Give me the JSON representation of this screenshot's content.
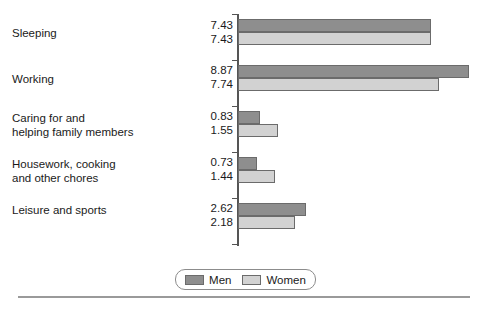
{
  "chart_data": {
    "type": "bar",
    "orientation": "horizontal",
    "title": "",
    "subtitle": "",
    "xlabel": "",
    "ylabel": "",
    "grid": false,
    "legend_position": "bottom-center",
    "xlim": [
      0,
      9.3
    ],
    "categories": [
      "Sleeping",
      "Working",
      "Caring for and\nhelping family members",
      "Housework, cooking\nand other chores",
      "Leisure and sports"
    ],
    "series": [
      {
        "name": "Men",
        "color": "#8e8e8e",
        "values": [
          7.43,
          8.87,
          0.83,
          0.73,
          2.62
        ],
        "labels": [
          "7.43",
          "8.87",
          "0.83",
          "0.73",
          "2.62"
        ]
      },
      {
        "name": "Women",
        "color": "#d2d2d2",
        "values": [
          7.43,
          7.74,
          1.55,
          1.44,
          2.18
        ],
        "labels": [
          "7.43",
          "7.74",
          "1.55",
          "1.44",
          "2.18"
        ]
      }
    ]
  },
  "legend": {
    "items": [
      {
        "label": "Men",
        "swatch": "men-swatch"
      },
      {
        "label": "Women",
        "swatch": "women-swatch"
      }
    ]
  }
}
